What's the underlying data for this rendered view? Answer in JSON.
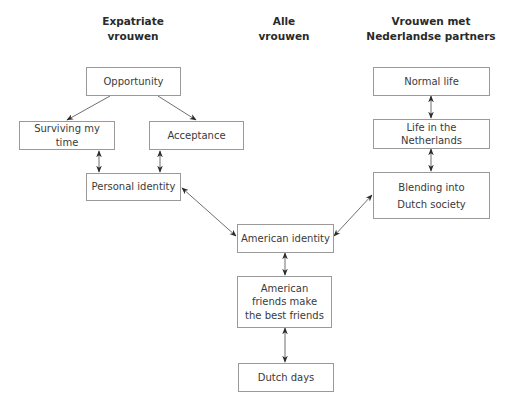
{
  "headers": {
    "expatriate": {
      "line1": "Expatriate",
      "line2": "vrouwen"
    },
    "all": {
      "line1": "Alle",
      "line2": "vrouwen"
    },
    "dutch_partners": {
      "line1": "Vrouwen met",
      "line2": "Nederlandse partners"
    }
  },
  "nodes": {
    "opportunity": "Opportunity",
    "surviving": "Surviving my time",
    "acceptance": "Acceptance",
    "personal_identity": "Personal identity",
    "normal_life": "Normal life",
    "life_netherlands": "Life in the Netherlands",
    "blending": "Blending into Dutch society",
    "american_identity": "American identity",
    "american_friends": "American friends make the best friends",
    "dutch_days": "Dutch days"
  },
  "edges": [
    {
      "from": "opportunity",
      "to": "surviving",
      "type": "directed"
    },
    {
      "from": "opportunity",
      "to": "acceptance",
      "type": "directed"
    },
    {
      "from": "surviving",
      "to": "personal_identity",
      "type": "bidirectional"
    },
    {
      "from": "acceptance",
      "to": "personal_identity",
      "type": "bidirectional"
    },
    {
      "from": "normal_life",
      "to": "life_netherlands",
      "type": "bidirectional"
    },
    {
      "from": "life_netherlands",
      "to": "blending",
      "type": "bidirectional"
    },
    {
      "from": "personal_identity",
      "to": "american_identity",
      "type": "bidirectional"
    },
    {
      "from": "blending",
      "to": "american_identity",
      "type": "bidirectional"
    },
    {
      "from": "american_identity",
      "to": "american_friends",
      "type": "bidirectional"
    },
    {
      "from": "american_friends",
      "to": "dutch_days",
      "type": "bidirectional"
    }
  ],
  "colors": {
    "line": "#6f6f6f",
    "arrowhead": "#2a2a2a",
    "box_border": "#9a9a9a",
    "text": "#3a3a3a"
  }
}
